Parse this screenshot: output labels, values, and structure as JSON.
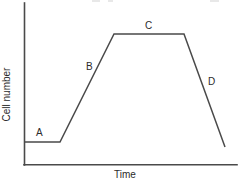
{
  "chart_data": {
    "type": "line",
    "title": "",
    "xlabel": "Time",
    "ylabel": "Cell number",
    "grid": false,
    "legend": null,
    "axes": {
      "x_axis_visible": true,
      "y_axis_visible": true,
      "x_ticks": [],
      "y_ticks": [],
      "xlim": [
        0,
        100
      ],
      "ylim": [
        0,
        100
      ]
    },
    "line_color": "#4a4a4a",
    "background_color": "#ffffff",
    "series": [
      {
        "name": "Cell growth curve",
        "x": [
          0,
          18,
          45,
          80,
          100
        ],
        "y": [
          14,
          14,
          81,
          81,
          11
        ],
        "points_px": [
          {
            "x": 24,
            "y": 142
          },
          {
            "x": 60,
            "y": 142
          },
          {
            "x": 114,
            "y": 34
          },
          {
            "x": 184,
            "y": 34
          },
          {
            "x": 225,
            "y": 147
          }
        ]
      }
    ],
    "annotations": [
      {
        "id": "A",
        "label": "A",
        "phase": "lag",
        "x_px": 36,
        "y_px": 128
      },
      {
        "id": "B",
        "label": "B",
        "phase": "exponential",
        "x_px": 86,
        "y_px": 62
      },
      {
        "id": "C",
        "label": "C",
        "phase": "stationary",
        "x_px": 145,
        "y_px": 21
      },
      {
        "id": "D",
        "label": "D",
        "phase": "death",
        "x_px": 208,
        "y_px": 77
      }
    ]
  },
  "figure": {
    "ylabel": "Cell number",
    "xlabel": "Time",
    "labels": {
      "a": "A",
      "b": "B",
      "c": "C",
      "d": "D"
    }
  }
}
